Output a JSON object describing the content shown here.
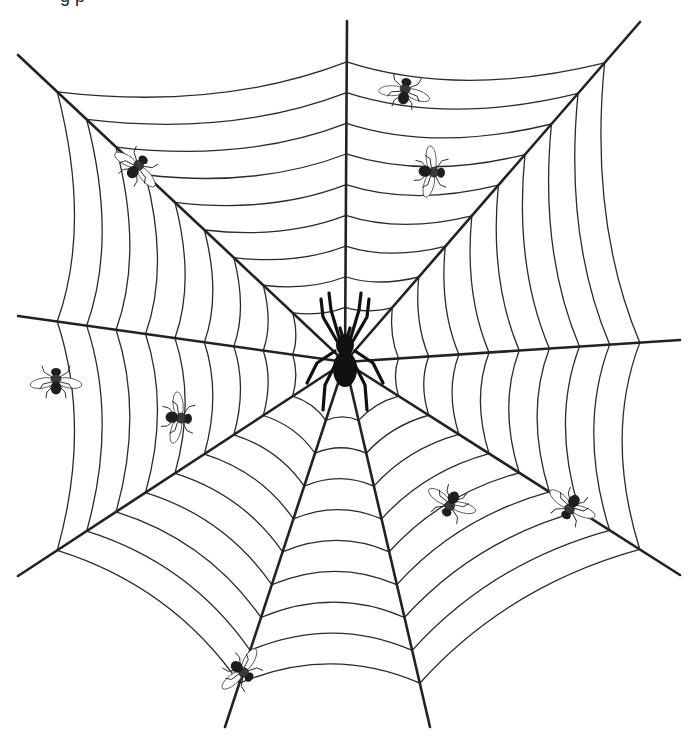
{
  "image": {
    "title": "Spider web with spider and flies",
    "cropped_caption": "g p",
    "background_color": "#ffffff",
    "line_color": "#222222"
  },
  "web": {
    "hub": [
      345,
      362
    ],
    "radials": [
      {
        "name": "top",
        "end": [
          347,
          21
        ]
      },
      {
        "name": "upper-right",
        "end": [
          640,
          22
        ]
      },
      {
        "name": "right",
        "end": [
          680,
          340
        ]
      },
      {
        "name": "lower-right",
        "end": [
          680,
          575
        ]
      },
      {
        "name": "bottom-right",
        "end": [
          430,
          727
        ]
      },
      {
        "name": "bottom-left",
        "end": [
          225,
          727
        ]
      },
      {
        "name": "lower-left",
        "end": [
          18,
          576
        ]
      },
      {
        "name": "left",
        "end": [
          18,
          316
        ]
      },
      {
        "name": "upper-left",
        "end": [
          18,
          55
        ]
      }
    ],
    "spiral_fractions": [
      0.16,
      0.25,
      0.34,
      0.43,
      0.52,
      0.61,
      0.7,
      0.79,
      0.88
    ],
    "spiral_sag": 0.12
  },
  "spider": {
    "position": [
      345,
      355
    ],
    "color": "#111111"
  },
  "flies": [
    {
      "id": "fly-1",
      "x": 138,
      "y": 166,
      "angle": 40
    },
    {
      "id": "fly-2",
      "x": 405,
      "y": 90,
      "angle": 10
    },
    {
      "id": "fly-3",
      "x": 433,
      "y": 172,
      "angle": 95
    },
    {
      "id": "fly-4",
      "x": 56,
      "y": 380,
      "angle": 0
    },
    {
      "id": "fly-5",
      "x": 180,
      "y": 418,
      "angle": 95
    },
    {
      "id": "fly-6",
      "x": 450,
      "y": 505,
      "angle": 205
    },
    {
      "id": "fly-7",
      "x": 570,
      "y": 508,
      "angle": 210
    },
    {
      "id": "fly-8",
      "x": 243,
      "y": 672,
      "angle": 130
    }
  ]
}
